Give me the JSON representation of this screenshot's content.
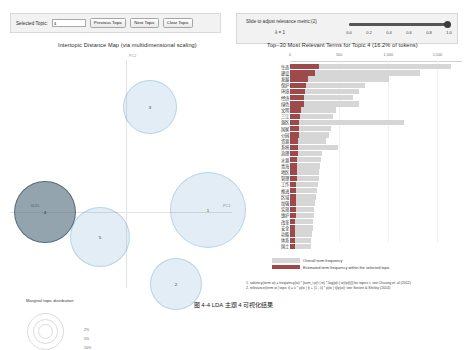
{
  "topic_control": {
    "label": "Selected Topic:",
    "value": "4",
    "placeholder": "4",
    "previous_label": "Previous Topic",
    "next_label": "Next Topic",
    "clear_label": "Clear Topic"
  },
  "lambda_control": {
    "title": "Slide to adjust relevance metric:(2)",
    "value_label": "λ = 1",
    "slider_value": 1.0,
    "ticks": [
      "0.0",
      "0.2",
      "0.4",
      "0.6",
      "0.8",
      "1.0"
    ]
  },
  "left_panel": {
    "title": "Intertopic Distance Map (via multidimensional scaling)",
    "x_axis_label": "PC1",
    "y_axis_label": "PC2",
    "legend_title": "Marginal topic distribution",
    "legend_sizes": [
      "2%",
      "5%",
      "10%"
    ]
  },
  "right_panel": {
    "title": "Top–30 Most Relevant Terms for Topic 4 (16.2% of tokens)",
    "x_ticks": [
      "0",
      "500",
      "1,000",
      "1,500"
    ],
    "x_max": 1750,
    "legend": {
      "overall": "Overall term frequency",
      "topic": "Estimated term frequency within the selected topic"
    },
    "footnotes": [
      "1. saliency(term w) = frequency(w) * [sum_t p(t | w) * log(p(t | w)/p(t))] for topics t; see Chuang et. al (2012)",
      "2. relevance(term w | topic t) = λ * p(w | t) + (1 - λ) * p(w | t)/p(w); see Sievert & Shirley (2014)"
    ]
  },
  "caption": "图 4-4   LDA 主题 4 可视化结果",
  "colors": {
    "topic_bar": "#9e4a4a",
    "overall_bar": "#d6d6d6",
    "bubble": "#1f77b4",
    "bubble_selected": "#3c5a6e",
    "panel_bg": "#f2f2f2"
  },
  "chart_data": {
    "type": "bar",
    "title": "Top–30 Most Relevant Terms for Topic 4 (16.2% of tokens)",
    "xlabel": "",
    "ylabel": "",
    "xlim": [
      0,
      1750
    ],
    "grid": false,
    "legend_position": "bottom",
    "categories": [
      "生态",
      "建设",
      "发展",
      "保护",
      "环境",
      "经济",
      "绿色",
      "文明",
      "三江",
      "源区",
      "国家",
      "公园",
      "资源",
      "系统",
      "治理",
      "水源",
      "青海",
      "地区",
      "管理",
      "工作",
      "推进",
      "区域",
      "加强",
      "实现",
      "维护",
      "改革",
      "安全",
      "功能",
      "体系",
      "国土"
    ],
    "series": [
      {
        "name": "Overall term frequency",
        "values": [
          1640,
          1320,
          1010,
          760,
          700,
          640,
          700,
          470,
          440,
          1160,
          420,
          400,
          370,
          490,
          330,
          320,
          310,
          300,
          290,
          280,
          275,
          265,
          255,
          245,
          240,
          235,
          230,
          225,
          215,
          210
        ]
      },
      {
        "name": "Estimated term frequency within the selected topic",
        "values": [
          290,
          250,
          180,
          160,
          150,
          145,
          140,
          110,
          100,
          95,
          90,
          88,
          85,
          80,
          78,
          75,
          72,
          70,
          68,
          66,
          64,
          62,
          60,
          58,
          56,
          54,
          52,
          50,
          48,
          46
        ]
      }
    ]
  },
  "bubbles": [
    {
      "id": "3",
      "label": "3",
      "cx": 142,
      "cy": 55,
      "r": 27,
      "selected": false
    },
    {
      "id": "4",
      "label": "4",
      "cx": 37,
      "cy": 160,
      "r": 31,
      "selected": true,
      "pct": "16.2%"
    },
    {
      "id": "5",
      "label": "5",
      "cx": 92,
      "cy": 185,
      "r": 30,
      "selected": false
    },
    {
      "id": "1",
      "label": "1",
      "cx": 200,
      "cy": 158,
      "r": 38,
      "selected": false
    },
    {
      "id": "2",
      "label": "2",
      "cx": 168,
      "cy": 232,
      "r": 26,
      "selected": false
    }
  ]
}
